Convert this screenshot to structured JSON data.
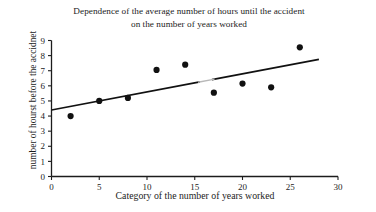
{
  "chart_data": {
    "type": "scatter",
    "title": "Dependence of the average number of hours until the accident on the number of years worked",
    "title_lines": [
      "Dependence of the average number of hours until the accident",
      "on the number of years worked"
    ],
    "xlabel": "Category of the number of years worked",
    "ylabel": "number of hourst before the accidnet",
    "xlim": [
      0,
      30
    ],
    "ylim": [
      0,
      9
    ],
    "xticks": [
      0,
      5,
      10,
      15,
      20,
      25,
      30
    ],
    "yticks": [
      0,
      1,
      2,
      3,
      4,
      5,
      6,
      7,
      8,
      9
    ],
    "xtick_labels": [
      "0",
      "5",
      "10",
      "15",
      "20",
      "25",
      "30"
    ],
    "ytick_labels": [
      "0",
      "1",
      "2",
      "3",
      "4",
      "5",
      "6",
      "7",
      "8",
      "9"
    ],
    "grid": false,
    "legend": false,
    "marker": "filled-circle",
    "marker_color": "#111111",
    "series": [
      {
        "name": "observations",
        "x": [
          2,
          5,
          8,
          11,
          14,
          17,
          20,
          23,
          26
        ],
        "y": [
          4.0,
          5.0,
          5.2,
          7.05,
          7.4,
          5.55,
          6.15,
          5.9,
          8.55
        ]
      }
    ],
    "trendline": {
      "type": "linear",
      "color": "#111111",
      "x_start": 0,
      "y_start": 4.4,
      "x_end": 28,
      "y_end": 7.75
    }
  },
  "axis": {
    "x_axis_name": "x-axis",
    "y_axis_name": "y-axis"
  }
}
